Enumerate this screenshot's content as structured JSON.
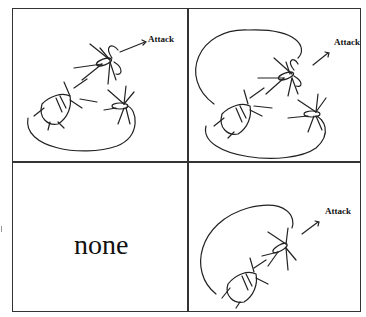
{
  "panels": [
    {
      "id": "top-left",
      "label": "Attack",
      "content": "spider-attack-diagram",
      "loops": 1
    },
    {
      "id": "top-right",
      "label": "Attack",
      "content": "spider-attack-diagram-double-loop",
      "loops": 2
    },
    {
      "id": "bottom-left",
      "label": "none",
      "content": "empty"
    },
    {
      "id": "bottom-right",
      "label": "Attack",
      "content": "spider-attack-diagram-single-spider",
      "loops": 1
    }
  ],
  "colors": {
    "line": "#222222",
    "border": "#333333",
    "background": "#ffffff"
  }
}
